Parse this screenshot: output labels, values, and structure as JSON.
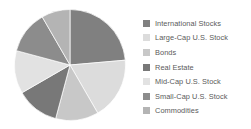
{
  "chart_data": {
    "type": "pie",
    "title": "",
    "subtitle": "",
    "xlabel": "",
    "ylabel": "",
    "grid": false,
    "legend_position": "right",
    "start_angle_deg": 0,
    "direction": "clockwise",
    "categories": [
      "International Stocks",
      "Large-Cap U.S. Stock",
      "Bonds",
      "Real Estate",
      "Mid-Cap U.S. Stock",
      "Small-Cap U.S. Stock",
      "Commodities"
    ],
    "values": [
      23.6,
      18.1,
      12.5,
      12.5,
      12.5,
      12.5,
      8.3
    ],
    "colors": [
      "#808080",
      "#dcdcdc",
      "#c8c8c8",
      "#787878",
      "#e2e2e2",
      "#8c8c8c",
      "#b4b4b4"
    ],
    "slices": [
      {
        "label": "International Stocks",
        "value": 23.6,
        "start_deg": 0,
        "end_deg": 85,
        "color": "#808080"
      },
      {
        "label": "Large-Cap U.S. Stock",
        "value": 18.1,
        "start_deg": 85,
        "end_deg": 150,
        "color": "#dcdcdc"
      },
      {
        "label": "Bonds",
        "value": 12.5,
        "start_deg": 150,
        "end_deg": 195,
        "color": "#c8c8c8"
      },
      {
        "label": "Real Estate",
        "value": 12.5,
        "start_deg": 195,
        "end_deg": 240,
        "color": "#787878"
      },
      {
        "label": "Mid-Cap U.S. Stock",
        "value": 12.5,
        "start_deg": 240,
        "end_deg": 285,
        "color": "#e2e2e2"
      },
      {
        "label": "Small-Cap U.S. Stock",
        "value": 12.5,
        "start_deg": 285,
        "end_deg": 330,
        "color": "#8c8c8c"
      },
      {
        "label": "Commodities",
        "value": 8.3,
        "start_deg": 330,
        "end_deg": 360,
        "color": "#b4b4b4"
      }
    ]
  },
  "legend": {
    "items": [
      {
        "label": "International Stocks",
        "color": "#808080",
        "swatch_name": "legend-swatch-international-stocks"
      },
      {
        "label": "Large-Cap U.S. Stock",
        "color": "#dcdcdc",
        "swatch_name": "legend-swatch-large-cap-us-stock"
      },
      {
        "label": "Bonds",
        "color": "#c8c8c8",
        "swatch_name": "legend-swatch-bonds"
      },
      {
        "label": "Real Estate",
        "color": "#787878",
        "swatch_name": "legend-swatch-real-estate"
      },
      {
        "label": "Mid-Cap U.S. Stock",
        "color": "#e2e2e2",
        "swatch_name": "legend-swatch-mid-cap-us-stock"
      },
      {
        "label": "Small-Cap U.S. Stock",
        "color": "#8c8c8c",
        "swatch_name": "legend-swatch-small-cap-us-stock"
      },
      {
        "label": "Commodities",
        "color": "#b4b4b4",
        "swatch_name": "legend-swatch-commodities"
      }
    ]
  }
}
